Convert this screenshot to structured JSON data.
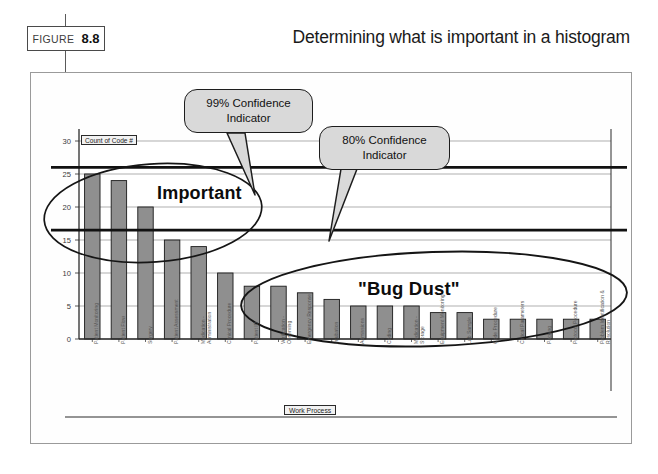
{
  "header": {
    "figure_word": "FIGURE",
    "figure_number": "8.8",
    "title": "Determining what is important in a histogram"
  },
  "annotations": {
    "callout_99": "99% Confidence Indicator",
    "callout_99_line1": "99% Confidence",
    "callout_99_line2": "Indicator",
    "callout_80": "80% Confidence Indicator",
    "callout_80_line1": "80% Confidence",
    "callout_80_line2": "Indicator",
    "region_important": "Important",
    "region_bugdust": "\"Bug Dust\""
  },
  "chart_data": {
    "type": "bar",
    "title": "",
    "series_label": "Count of Code #",
    "xlabel": "Work Process",
    "ylabel": "",
    "ylim": [
      0,
      30
    ],
    "yticks": [
      0,
      5,
      10,
      15,
      20,
      25,
      30
    ],
    "ytick_labels": [
      "0",
      "5",
      "10",
      "15",
      "20",
      "25",
      "30"
    ],
    "grid": true,
    "legend": "none",
    "bar_color": "#8f8f8f",
    "bar_edge_color": "#1a1a1a",
    "categories": [
      "Patient Monitoring",
      "Patient Flow",
      "Surgery",
      "Patient Assessment",
      "Medication - Administration",
      "Clinical Procedure",
      "Patient ID",
      "Verification - Observing",
      "Emergency Response",
      "Intubation",
      "Admissions",
      "Coding",
      "Medication - Storage",
      "Equipment Monitoring",
      "Lab Sample",
      "Code Procedure",
      "Critical Parameters",
      "Packing",
      "Protocol Procedure",
      "Problem Identification & Resolution"
    ],
    "values": [
      25,
      24,
      20,
      15,
      14,
      10,
      8,
      8,
      7,
      6,
      5,
      5,
      5,
      4,
      4,
      3,
      3,
      3,
      3,
      3
    ],
    "reference_lines": [
      {
        "name": "99% Confidence Indicator",
        "value": 26,
        "color": "#111111"
      },
      {
        "name": "80% Confidence Indicator",
        "value": 16.5,
        "color": "#111111"
      }
    ],
    "highlight_regions": [
      {
        "name": "Important",
        "label": "Important",
        "from_category_index": 0,
        "to_category_index": 3
      },
      {
        "name": "Bug Dust",
        "label": "\"Bug Dust\"",
        "from_category_index": 6,
        "to_category_index": 19
      }
    ]
  }
}
